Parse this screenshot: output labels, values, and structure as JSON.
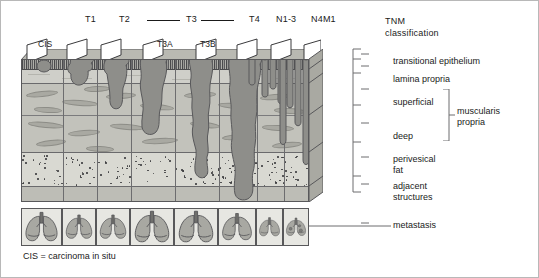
{
  "figure": {
    "caption": "CIS = carcinoma in situ",
    "heading": {
      "line1": "TNM",
      "line2": "classification"
    }
  },
  "stage_labels": [
    {
      "key": "t1",
      "text": "T1",
      "x": 84,
      "y": 14
    },
    {
      "key": "t2",
      "text": "T2",
      "x": 118,
      "y": 14
    },
    {
      "key": "t3",
      "text": "T3",
      "x": 185,
      "y": 14
    },
    {
      "key": "t4",
      "text": "T4",
      "x": 248,
      "y": 14
    },
    {
      "key": "n13",
      "text": "N1-3",
      "x": 277,
      "y": 14
    },
    {
      "key": "n4m1",
      "text": "N4M1",
      "x": 311,
      "y": 14
    }
  ],
  "stage_rules": [
    {
      "key": "t3-left",
      "x": 146,
      "y": 19,
      "width": 33
    },
    {
      "key": "t3-right",
      "x": 196,
      "y": 19,
      "width": 33
    }
  ],
  "panel_labels": [
    {
      "key": "cis",
      "text": "CIS",
      "x": 37,
      "y": 40
    },
    {
      "key": "t3a",
      "text": "T3A",
      "x": 156,
      "y": 40
    },
    {
      "key": "t3b",
      "text": "T3B",
      "x": 198,
      "y": 40
    }
  ],
  "layers": [
    {
      "key": "transitional-epithelium",
      "label": "transitional epithelium",
      "top": 0,
      "height": 10,
      "kind": "ep"
    },
    {
      "key": "lamina-propria",
      "label": "lamina propria",
      "top": 10,
      "height": 14,
      "kind": "lp"
    },
    {
      "key": "superficial",
      "label": "superficial",
      "top": 24,
      "height": 32,
      "kind": "sup"
    },
    {
      "key": "deep",
      "label": "deep",
      "top": 56,
      "height": 37,
      "kind": "deep"
    },
    {
      "key": "perivesical-fat",
      "label": "perivesical fat",
      "top": 93,
      "height": 34,
      "kind": "fat"
    },
    {
      "key": "adjacent-structures",
      "label": "adjacent structures",
      "top": 127,
      "height": 16,
      "kind": "adj"
    }
  ],
  "side_labels": [
    {
      "key": "transitional-epithelium",
      "lines": [
        "transitional epithelium"
      ],
      "x": 392,
      "y": 60
    },
    {
      "key": "lamina-propria",
      "lines": [
        "lamina propria"
      ],
      "x": 392,
      "y": 79
    },
    {
      "key": "superficial",
      "lines": [
        "superficial"
      ],
      "x": 392,
      "y": 99
    },
    {
      "key": "deep",
      "lines": [
        "deep"
      ],
      "x": 392,
      "y": 128
    },
    {
      "key": "perivesical-fat",
      "lines": [
        "perivesical",
        "fat"
      ],
      "x": 392,
      "y": 155
    },
    {
      "key": "adjacent-structures",
      "lines": [
        "adjacent",
        "structures"
      ],
      "x": 392,
      "y": 182
    },
    {
      "key": "metastasis",
      "lines": [
        "metastasis"
      ],
      "x": 392,
      "y": 222
    }
  ],
  "group_label": {
    "key": "muscularis-propria",
    "lines": [
      "muscularis",
      "propria"
    ],
    "x": 452,
    "y": 108
  },
  "colors": {
    "outline": "#58585a",
    "tumour_fill": "#8e8e8a",
    "tumour_stroke": "#59595b",
    "epithelium": "#4a4a4c",
    "lamina_propria": "#cfcfc9",
    "muscularis": "#c2c2bb",
    "fat": "#d9d9d2",
    "adjacent": "#bdbdb6",
    "lung_fill": "#a8a8a2",
    "background": "#ffffff",
    "text": "#1a1a1a"
  },
  "panels": [
    {
      "key": "cis",
      "stage": "CIS",
      "x": 0,
      "width": 41
    },
    {
      "key": "t1",
      "stage": "T1",
      "x": 41,
      "width": 34
    },
    {
      "key": "t2",
      "stage": "T2",
      "x": 75,
      "width": 34
    },
    {
      "key": "t3a",
      "stage": "T3A",
      "x": 109,
      "width": 44
    },
    {
      "key": "t3b",
      "stage": "T3B",
      "x": 153,
      "width": 44
    },
    {
      "key": "t4",
      "stage": "T4",
      "x": 197,
      "width": 38
    },
    {
      "key": "n13",
      "stage": "N1-3",
      "x": 235,
      "width": 27
    },
    {
      "key": "n4m1",
      "stage": "N4M1",
      "x": 262,
      "width": 26
    }
  ],
  "metastasis_cells": [
    {
      "key": "lung-cis",
      "x": 0,
      "width": 41,
      "nodules": 0
    },
    {
      "key": "lung-t1",
      "x": 41,
      "width": 34,
      "nodules": 0
    },
    {
      "key": "lung-t2",
      "x": 75,
      "width": 34,
      "nodules": 0
    },
    {
      "key": "lung-t3a",
      "x": 109,
      "width": 44,
      "nodules": 0
    },
    {
      "key": "lung-t3b",
      "x": 153,
      "width": 44,
      "nodules": 0
    },
    {
      "key": "lung-t4",
      "x": 197,
      "width": 38,
      "nodules": 0
    },
    {
      "key": "lung-n13",
      "x": 235,
      "width": 27,
      "nodules": 0
    },
    {
      "key": "lung-n4m1",
      "x": 262,
      "width": 26,
      "nodules": 3
    }
  ]
}
